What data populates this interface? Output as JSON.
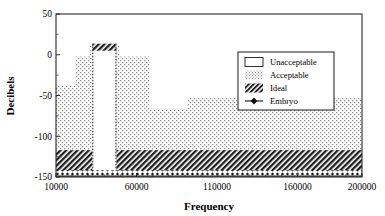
{
  "chart_data": {
    "type": "area",
    "title": "",
    "xlabel": "Frequency",
    "ylabel": "Decibels",
    "xlim": [
      10000,
      200000
    ],
    "ylim": [
      -150,
      50
    ],
    "grid": false,
    "legend_position": "upper-right",
    "xticks": [
      10000,
      60000,
      110000,
      160000,
      200000
    ],
    "xtick_labels": [
      "10000",
      "60000",
      "110000",
      "160000",
      "200000"
    ],
    "yticks": [
      50,
      0,
      -50,
      -100,
      -150
    ],
    "ytick_labels": [
      "50",
      "0",
      "-50",
      "-100",
      "-150"
    ],
    "series": [
      {
        "name": "Acceptable",
        "fill": "dotted-stipple",
        "description": "Stepped upper envelope of the acceptable decibel region, filled from its top boundary down to the top of the Ideal band.",
        "x": [
          10000,
          22000,
          22000,
          30500,
          30500,
          32500,
          32500,
          47500,
          47500,
          49500,
          49500,
          68000,
          68000,
          92000,
          92000,
          200000
        ],
        "y": [
          -38,
          -38,
          -2,
          -2,
          12,
          12,
          5,
          5,
          12,
          12,
          -2,
          -2,
          -67,
          -67,
          -53,
          -53
        ]
      },
      {
        "name": "Unacceptable",
        "fill": "white",
        "description": "White vertical notch band where response is unacceptable.",
        "x_range": [
          32500,
          47500
        ],
        "y_range": [
          -143,
          5
        ]
      },
      {
        "name": "Ideal",
        "fill": "diagonal-hatch",
        "description": "Hatched band of ideal decibel levels spanning the full frequency range, interrupted by the unacceptable notch.",
        "y_range": [
          -143,
          -117
        ],
        "x_range": [
          10000,
          200000
        ]
      },
      {
        "name": "Embryo",
        "fill": "marker-line",
        "description": "Dark marker trace running along the bottom of the plot.",
        "y_value": -145,
        "x_range": [
          10000,
          200000
        ]
      }
    ],
    "legend_entries": [
      {
        "label": "Unacceptable",
        "swatch": "open-rectangle"
      },
      {
        "label": "Acceptable",
        "swatch": "dotted-fill"
      },
      {
        "label": "Ideal",
        "swatch": "diagonal-hatch"
      },
      {
        "label": "Embryo",
        "swatch": "marker-diamond-line"
      }
    ],
    "colors": {
      "axis": "#2b2b2b",
      "stipple": "#8a8a8a",
      "hatch": "#1f1f1f",
      "embryo": "#101010",
      "background": "#ffffff"
    }
  }
}
